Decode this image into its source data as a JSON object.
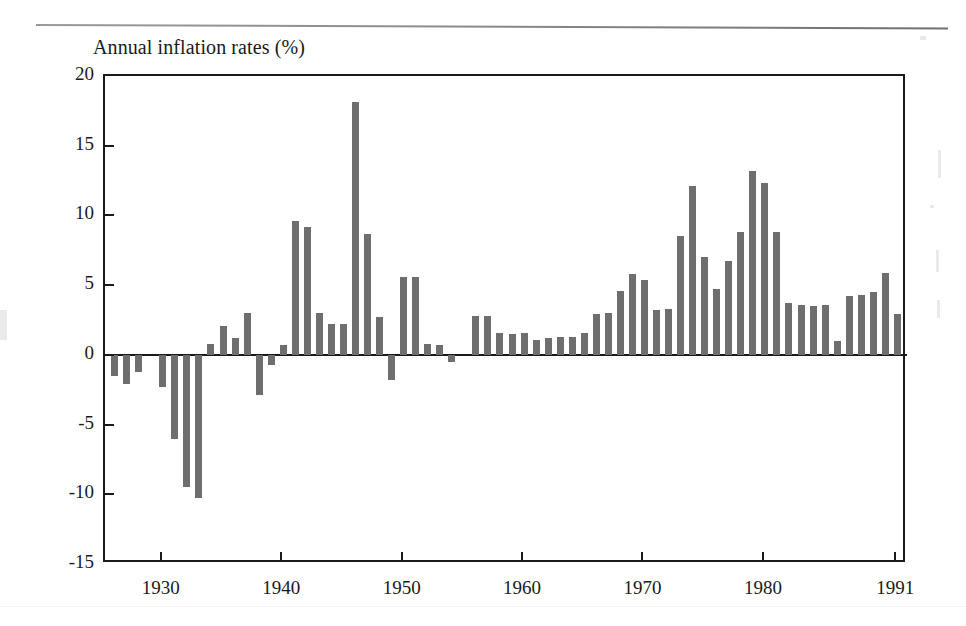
{
  "page": {
    "background_color": "#ffffff",
    "ink_color": "#1a1a1a",
    "bar_color": "#6e6e6e",
    "divider_rule": "horizontal-rule"
  },
  "chart_data": {
    "type": "bar",
    "title": "Annual inflation rates (%)",
    "xlabel": "",
    "ylabel": "",
    "ylim": [
      -15,
      20
    ],
    "xlim": [
      1925.2,
      1991.8
    ],
    "ytick_labels": [
      "20",
      "15",
      "10",
      "5",
      "0",
      "-5",
      "-10",
      "-15"
    ],
    "yticks": [
      20,
      15,
      10,
      5,
      0,
      -5,
      -10,
      -15
    ],
    "xtick_labels": [
      "1930",
      "1940",
      "1950",
      "1960",
      "1970",
      "1980",
      "1991"
    ],
    "xticks": [
      1930,
      1940,
      1950,
      1960,
      1970,
      1980,
      1991
    ],
    "grid": false,
    "legend": null,
    "categories": [
      1926,
      1927,
      1928,
      1929,
      1930,
      1931,
      1932,
      1933,
      1934,
      1935,
      1936,
      1937,
      1938,
      1939,
      1940,
      1941,
      1942,
      1943,
      1944,
      1945,
      1946,
      1947,
      1948,
      1949,
      1950,
      1951,
      1952,
      1953,
      1954,
      1955,
      1956,
      1957,
      1958,
      1959,
      1960,
      1961,
      1962,
      1963,
      1964,
      1965,
      1966,
      1967,
      1968,
      1969,
      1970,
      1971,
      1972,
      1973,
      1974,
      1975,
      1976,
      1977,
      1978,
      1979,
      1980,
      1981,
      1982,
      1983,
      1984,
      1985,
      1986,
      1987,
      1988,
      1989,
      1990,
      1991
    ],
    "values": [
      -1.5,
      -2.1,
      -1.2,
      0.0,
      -2.3,
      -6.0,
      -9.5,
      -10.3,
      0.8,
      2.1,
      1.2,
      3.0,
      -2.9,
      -0.7,
      0.7,
      9.6,
      9.2,
      3.0,
      2.2,
      2.2,
      18.1,
      8.7,
      2.7,
      -1.8,
      5.6,
      5.6,
      0.8,
      0.7,
      -0.5,
      0.0,
      2.8,
      2.8,
      1.6,
      1.5,
      1.6,
      1.1,
      1.2,
      1.3,
      1.3,
      1.6,
      2.9,
      3.0,
      4.6,
      5.8,
      5.4,
      3.2,
      3.3,
      8.5,
      12.1,
      7.0,
      4.7,
      6.7,
      8.8,
      13.2,
      12.3,
      8.8,
      3.7,
      3.6,
      3.5,
      3.6,
      1.0,
      4.2,
      4.3,
      4.5,
      5.9,
      2.9
    ]
  }
}
